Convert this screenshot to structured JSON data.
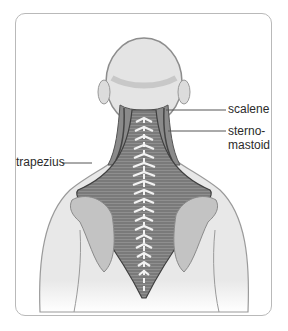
{
  "figure": {
    "labels": [
      {
        "id": "scalene",
        "text": "scalene"
      },
      {
        "id": "sternomastoid",
        "line1": "sterno-",
        "line2": "mastoid"
      },
      {
        "id": "trapezius",
        "text": "trapezius"
      }
    ]
  },
  "colors": {
    "frame": "#b9b9b9",
    "skin": "#e6e6e6",
    "muscle": "#7d7d7d",
    "spine": "#f2f2f2",
    "outline": "#8a8a8a",
    "leader": "#555555",
    "text": "#2b2b2b"
  }
}
